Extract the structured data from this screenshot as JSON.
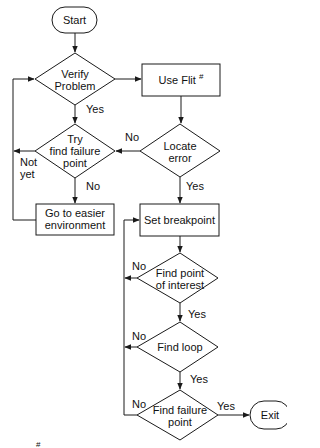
{
  "diagram": {
    "type": "flowchart",
    "nodes": {
      "start": {
        "shape": "terminal",
        "label": "Start"
      },
      "verify": {
        "shape": "decision",
        "line1": "Verify",
        "line2": "Problem"
      },
      "flit": {
        "shape": "process",
        "label": "Use Flit",
        "superscript": "#"
      },
      "try_find": {
        "shape": "decision",
        "line1": "Try",
        "line2": "find failure",
        "line3": "point"
      },
      "locate": {
        "shape": "decision",
        "line1": "Locate",
        "line2": "error"
      },
      "easier": {
        "shape": "process",
        "line1": "Go to easier",
        "line2": "environment"
      },
      "breakpoint": {
        "shape": "process",
        "label": "Set breakpoint"
      },
      "poi": {
        "shape": "decision",
        "line1": "Find point",
        "line2": "of interest"
      },
      "loop": {
        "shape": "decision",
        "label": "Find loop"
      },
      "failure": {
        "shape": "decision",
        "line1": "Find failure",
        "line2": "point"
      },
      "exit": {
        "shape": "terminal",
        "label": "Exit"
      }
    },
    "edge_labels": {
      "verify_yes": "Yes",
      "locate_no": "No",
      "try_not_yet_1": "Not",
      "try_not_yet_2": "yet",
      "try_no": "No",
      "locate_yes": "Yes",
      "poi_no": "No",
      "poi_yes": "Yes",
      "loop_no": "No",
      "loop_yes": "Yes",
      "failure_no": "No",
      "failure_yes": "Yes"
    },
    "edges": [
      {
        "from": "start",
        "to": "verify"
      },
      {
        "from": "verify",
        "to": "flit"
      },
      {
        "from": "verify",
        "to": "try_find",
        "label": "Yes"
      },
      {
        "from": "flit",
        "to": "locate"
      },
      {
        "from": "locate",
        "to": "try_find",
        "label": "No"
      },
      {
        "from": "locate",
        "to": "breakpoint",
        "label": "Yes"
      },
      {
        "from": "try_find",
        "to": "verify",
        "label": "Not yet"
      },
      {
        "from": "try_find",
        "to": "easier",
        "label": "No"
      },
      {
        "from": "easier",
        "to": "verify"
      },
      {
        "from": "breakpoint",
        "to": "poi"
      },
      {
        "from": "poi",
        "to": "breakpoint",
        "label": "No"
      },
      {
        "from": "poi",
        "to": "loop",
        "label": "Yes"
      },
      {
        "from": "loop",
        "to": "breakpoint",
        "label": "No"
      },
      {
        "from": "loop",
        "to": "failure",
        "label": "Yes"
      },
      {
        "from": "failure",
        "to": "breakpoint",
        "label": "No"
      },
      {
        "from": "failure",
        "to": "exit",
        "label": "Yes"
      }
    ],
    "footnote_mark": "#"
  },
  "colors": {
    "stroke": "#1a1a1a",
    "background": "#ffffff"
  }
}
